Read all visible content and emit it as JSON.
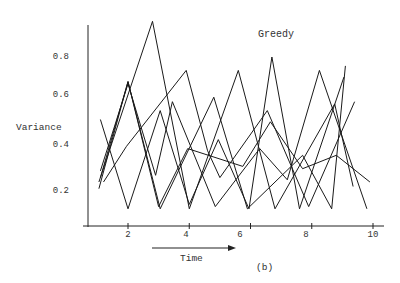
{
  "chart_data": {
    "type": "line",
    "title": "Greedy",
    "subtitle": "(b)",
    "xlabel": "Time",
    "ylabel": "Variance",
    "xlim": [
      0.6,
      10.3
    ],
    "ylim": [
      0.04,
      1.0
    ],
    "x_ticks": [
      2,
      4,
      6,
      8,
      10
    ],
    "x_tick_labels": [
      "2",
      "4",
      "6",
      "8",
      "10"
    ],
    "y_ticks": [
      0.2,
      0.4,
      0.6,
      0.8
    ],
    "y_tick_labels": [
      "0.2",
      "0.4",
      "0.6",
      "0.8"
    ],
    "grid": false,
    "legend": "none",
    "annotations": [
      {
        "text": "Greedy",
        "position": "upper right inside plot"
      },
      {
        "text": "Time",
        "with_arrow": "right-pointing arrow above label"
      },
      {
        "text": "(b)",
        "position": "below x-axis"
      }
    ],
    "series": [
      {
        "name": "run-1",
        "x": [
          1.1,
          2.0,
          3.05,
          4.8,
          5.9,
          7.7,
          8.65,
          9.1
        ],
        "y": [
          0.26,
          0.69,
          0.12,
          0.62,
          0.12,
          0.36,
          0.12,
          0.76
        ]
      },
      {
        "name": "run-2",
        "x": [
          1.05,
          2.8,
          4.0,
          5.6,
          6.8,
          8.75,
          9.35
        ],
        "y": [
          0.24,
          0.96,
          0.12,
          0.74,
          0.12,
          0.59,
          0.22
        ]
      },
      {
        "name": "run-3",
        "x": [
          1.1,
          2.0,
          3.05,
          4.0,
          4.95,
          5.95,
          6.7,
          7.6,
          9.05
        ],
        "y": [
          0.52,
          0.12,
          0.56,
          0.14,
          0.43,
          0.12,
          0.8,
          0.12,
          0.71
        ]
      },
      {
        "name": "run-4",
        "x": [
          1.1,
          2.0,
          2.9,
          3.45,
          4.85,
          6.3,
          7.2,
          8.25,
          9.8
        ],
        "y": [
          0.29,
          0.68,
          0.27,
          0.6,
          0.13,
          0.39,
          0.25,
          0.74,
          0.12
        ]
      },
      {
        "name": "run-5",
        "x": [
          1.05,
          2.0,
          3.0,
          3.95,
          5.75,
          6.65,
          7.7,
          8.8,
          9.9
        ],
        "y": [
          0.21,
          0.69,
          0.13,
          0.39,
          0.31,
          0.51,
          0.3,
          0.36,
          0.24
        ]
      },
      {
        "name": "run-6",
        "x": [
          1.2,
          1.95,
          3.9,
          4.6,
          5.0,
          6.55,
          7.9,
          9.4
        ],
        "y": [
          0.24,
          0.4,
          0.74,
          0.38,
          0.26,
          0.56,
          0.13,
          0.6
        ]
      }
    ]
  },
  "labels": {
    "title": "Greedy",
    "ylabel": "Variance",
    "xlabel": "Time",
    "caption": "(b)",
    "yticks": [
      "0.8",
      "0.6",
      "0.4",
      "0.2"
    ],
    "xticks": [
      "2",
      "4",
      "6",
      "8",
      "10"
    ]
  }
}
